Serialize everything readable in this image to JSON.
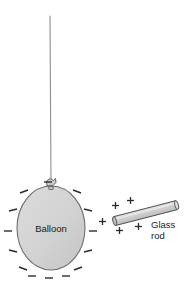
{
  "figure": {
    "background_color": "#ffffff",
    "width": 188,
    "height": 293
  },
  "balloon": {
    "label": "Balloon",
    "fill_color": "#d4d4d4",
    "stroke_color": "#6e6e6e",
    "center_x": 51,
    "center_y": 228,
    "radius_x": 34,
    "radius_y": 42,
    "charge_sign": "−",
    "charge_count": 12,
    "charge_color": "#2b2b2b"
  },
  "string": {
    "name": "balloon-string",
    "color": "#8a8a8a",
    "top_x": 50,
    "top_y": 16,
    "bottom_x": 51,
    "bottom_y": 182
  },
  "knot": {
    "name": "balloon-knot",
    "fill_color": "#c9c9c9",
    "stroke_color": "#5a5a5a"
  },
  "rod": {
    "label_line1": "Glass",
    "label_line2": "rod",
    "fill_color": "#cccccc",
    "stroke_color": "#555555",
    "highlight_color": "#e8e8e8",
    "x1": 114,
    "y1": 221,
    "x2": 177,
    "y2": 205,
    "thickness": 8,
    "charge_sign": "+",
    "charge_count": 6,
    "charge_color": "#2b2b2b"
  },
  "balloon_charges": [
    {
      "sign": "−",
      "x": 48,
      "y": 184,
      "angle": -90
    },
    {
      "sign": "−",
      "x": 24,
      "y": 194,
      "angle": -125
    },
    {
      "sign": "−",
      "x": 73,
      "y": 195,
      "angle": -55
    },
    {
      "sign": "−",
      "x": 13,
      "y": 212,
      "angle": -155
    },
    {
      "sign": "−",
      "x": 84,
      "y": 212,
      "angle": -25
    },
    {
      "sign": "−",
      "x": 10,
      "y": 231,
      "angle": 180
    },
    {
      "sign": "−",
      "x": 88,
      "y": 231,
      "angle": 0
    },
    {
      "sign": "−",
      "x": 13,
      "y": 250,
      "angle": 155
    },
    {
      "sign": "−",
      "x": 84,
      "y": 250,
      "angle": 25
    },
    {
      "sign": "−",
      "x": 25,
      "y": 266,
      "angle": 125
    },
    {
      "sign": "−",
      "x": 72,
      "y": 266,
      "angle": 55
    },
    {
      "sign": "−",
      "x": 49,
      "y": 275,
      "angle": 90
    }
  ],
  "rod_charges": [
    {
      "sign": "+",
      "x": 115,
      "y": 208
    },
    {
      "sign": "+",
      "x": 131,
      "y": 203
    },
    {
      "sign": "+",
      "x": 103,
      "y": 222
    },
    {
      "sign": "+",
      "x": 120,
      "y": 230
    },
    {
      "sign": "+",
      "x": 139,
      "y": 226
    }
  ],
  "labels": {
    "balloon_label_x": 51,
    "balloon_label_y": 232,
    "balloon_label_size": 9,
    "rod_label_x": 151,
    "rod_label_y1": 227,
    "rod_label_y2": 238,
    "rod_label_size": 9.5
  }
}
